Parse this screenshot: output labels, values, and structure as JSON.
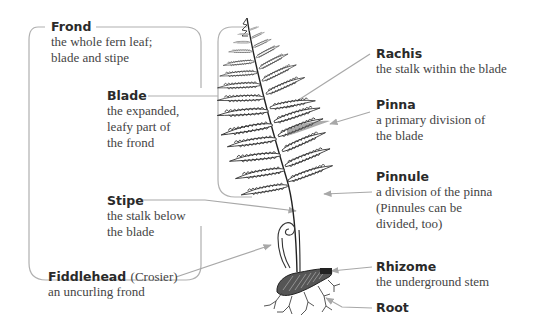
{
  "diagram": {
    "colors": {
      "background": "#ffffff",
      "term_text": "#2a2a2a",
      "desc_text": "#444444",
      "leader_line": "#a8a8a8",
      "bracket_line": "#b0b0b0",
      "illustration": "#333333"
    },
    "labels": {
      "frond": {
        "term": "Frond",
        "desc_lines": [
          "the whole fern leaf;",
          "blade and stipe"
        ]
      },
      "blade": {
        "term": "Blade",
        "desc_lines": [
          "the expanded,",
          "leafy part of",
          "the frond"
        ]
      },
      "stipe": {
        "term": "Stipe",
        "desc_lines": [
          "the stalk below",
          "the blade"
        ]
      },
      "fiddlehead": {
        "term": "Fiddlehead",
        "paren": "(Crosier)",
        "desc_lines": [
          "an uncurling frond"
        ]
      },
      "rachis": {
        "term": "Rachis",
        "desc_lines": [
          "the stalk within the blade"
        ]
      },
      "pinna": {
        "term": "Pinna",
        "desc_lines": [
          "a primary division of",
          "the blade"
        ]
      },
      "pinnule": {
        "term": "Pinnule",
        "desc_lines": [
          "a division of the pinna",
          "(Pinnules can be",
          "divided, too)"
        ]
      },
      "rhizome": {
        "term": "Rhizome",
        "desc_lines": [
          "the underground stem"
        ]
      },
      "root": {
        "term": "Root",
        "desc_lines": []
      }
    },
    "icons": {
      "fern": "fern-illustration",
      "fiddlehead": "fiddlehead-spiral",
      "rhizome": "rhizome-shape",
      "roots": "root-branches"
    }
  }
}
